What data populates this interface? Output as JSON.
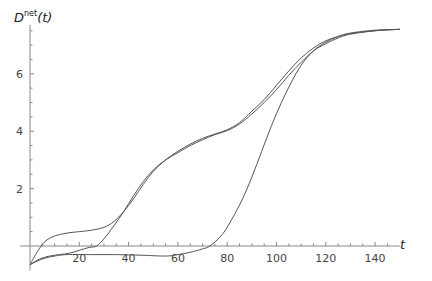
{
  "chart_data": {
    "type": "line",
    "title": "",
    "xlabel": "t",
    "ylabel": "D^net(t)",
    "ylabel_base": "D",
    "ylabel_sup": "net",
    "ylabel_arg": "(t)",
    "xlim": [
      0,
      152
    ],
    "ylim": [
      -0.8,
      7.7
    ],
    "x_ticks": [
      20,
      40,
      60,
      80,
      100,
      120,
      140
    ],
    "y_ticks": [
      2,
      4,
      6
    ],
    "grid": false,
    "legend": null,
    "series": [
      {
        "name": "curve-1",
        "points": [
          [
            0,
            -0.65
          ],
          [
            3,
            -0.2
          ],
          [
            6,
            0.15
          ],
          [
            10,
            0.35
          ],
          [
            15,
            0.45
          ],
          [
            20,
            0.5
          ],
          [
            25,
            0.55
          ],
          [
            30,
            0.65
          ],
          [
            34,
            0.85
          ],
          [
            38,
            1.2
          ],
          [
            42,
            1.65
          ],
          [
            46,
            2.15
          ],
          [
            50,
            2.6
          ],
          [
            55,
            3.0
          ],
          [
            60,
            3.3
          ],
          [
            65,
            3.55
          ],
          [
            70,
            3.75
          ],
          [
            75,
            3.9
          ],
          [
            80,
            4.05
          ],
          [
            85,
            4.3
          ],
          [
            90,
            4.7
          ],
          [
            95,
            5.1
          ],
          [
            100,
            5.6
          ],
          [
            105,
            6.1
          ],
          [
            110,
            6.55
          ],
          [
            115,
            6.9
          ],
          [
            120,
            7.15
          ],
          [
            125,
            7.3
          ],
          [
            130,
            7.4
          ],
          [
            140,
            7.5
          ],
          [
            150,
            7.55
          ]
        ]
      },
      {
        "name": "curve-2",
        "points": [
          [
            0,
            -0.65
          ],
          [
            4,
            -0.45
          ],
          [
            8,
            -0.35
          ],
          [
            12,
            -0.3
          ],
          [
            16,
            -0.25
          ],
          [
            20,
            -0.15
          ],
          [
            24,
            -0.05
          ],
          [
            27,
            0.0
          ],
          [
            30,
            0.25
          ],
          [
            34,
            0.7
          ],
          [
            38,
            1.2
          ],
          [
            42,
            1.75
          ],
          [
            46,
            2.25
          ],
          [
            50,
            2.65
          ],
          [
            55,
            3.0
          ],
          [
            60,
            3.25
          ],
          [
            65,
            3.5
          ],
          [
            70,
            3.7
          ],
          [
            75,
            3.88
          ],
          [
            80,
            4.02
          ],
          [
            85,
            4.25
          ],
          [
            90,
            4.6
          ],
          [
            95,
            5.0
          ],
          [
            100,
            5.45
          ],
          [
            105,
            5.95
          ],
          [
            110,
            6.4
          ],
          [
            115,
            6.8
          ],
          [
            120,
            7.05
          ],
          [
            125,
            7.25
          ],
          [
            130,
            7.38
          ],
          [
            140,
            7.5
          ],
          [
            150,
            7.55
          ]
        ]
      },
      {
        "name": "curve-3",
        "points": [
          [
            0,
            -0.65
          ],
          [
            5,
            -0.45
          ],
          [
            10,
            -0.35
          ],
          [
            15,
            -0.3
          ],
          [
            25,
            -0.3
          ],
          [
            35,
            -0.3
          ],
          [
            45,
            -0.32
          ],
          [
            55,
            -0.35
          ],
          [
            60,
            -0.3
          ],
          [
            65,
            -0.22
          ],
          [
            70,
            -0.1
          ],
          [
            73,
            0.0
          ],
          [
            78,
            0.4
          ],
          [
            82,
            0.95
          ],
          [
            86,
            1.6
          ],
          [
            90,
            2.4
          ],
          [
            94,
            3.3
          ],
          [
            98,
            4.2
          ],
          [
            102,
            5.0
          ],
          [
            106,
            5.7
          ],
          [
            110,
            6.3
          ],
          [
            115,
            6.8
          ],
          [
            120,
            7.1
          ],
          [
            125,
            7.3
          ],
          [
            130,
            7.42
          ],
          [
            140,
            7.52
          ],
          [
            150,
            7.55
          ]
        ]
      }
    ]
  }
}
